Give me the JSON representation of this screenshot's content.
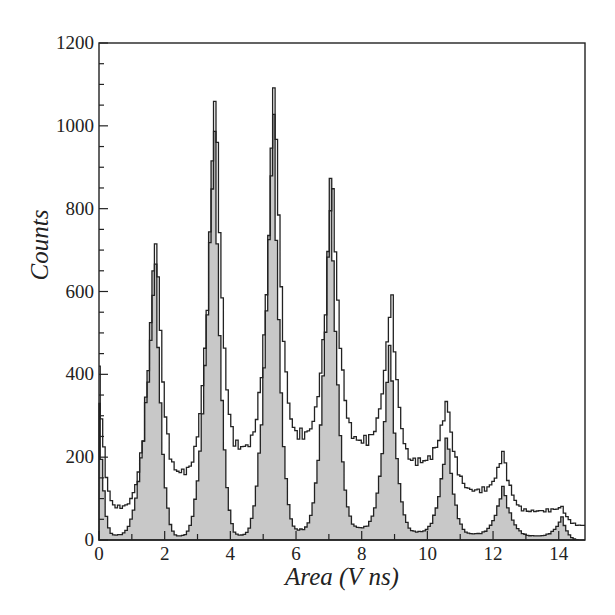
{
  "chart_data": {
    "type": "histogram",
    "title": "",
    "xlabel": "Area (V ns)",
    "ylabel": "Counts",
    "xlim": [
      0,
      14.8
    ],
    "ylim": [
      0,
      1200
    ],
    "xticks": [
      0,
      2,
      4,
      6,
      8,
      10,
      12,
      14
    ],
    "yticks": [
      0,
      200,
      400,
      600,
      800,
      1000,
      1200
    ],
    "grid": false,
    "legend": null,
    "series": [
      {
        "name": "Unfilled histogram (outline)",
        "style": "step-outline",
        "peaks": [
          {
            "x": 0.0,
            "y": 420
          },
          {
            "x": 1.75,
            "y": 760
          },
          {
            "x": 3.55,
            "y": 1125
          },
          {
            "x": 5.35,
            "y": 1150
          },
          {
            "x": 7.1,
            "y": 905
          },
          {
            "x": 8.9,
            "y": 615
          },
          {
            "x": 10.6,
            "y": 345
          },
          {
            "x": 12.3,
            "y": 215
          },
          {
            "x": 14.1,
            "y": 80
          }
        ],
        "valleys": [
          {
            "x": 0.6,
            "y": 80
          },
          {
            "x": 2.5,
            "y": 165
          },
          {
            "x": 4.35,
            "y": 225
          },
          {
            "x": 6.15,
            "y": 255
          },
          {
            "x": 8.0,
            "y": 240
          },
          {
            "x": 9.7,
            "y": 190
          },
          {
            "x": 11.5,
            "y": 120
          },
          {
            "x": 13.2,
            "y": 70
          },
          {
            "x": 14.8,
            "y": 35
          }
        ]
      },
      {
        "name": "Filled histogram (gray)",
        "style": "step-filled",
        "fill": "#c8c8c8",
        "peaks": [
          {
            "x": 0.0,
            "y": 330
          },
          {
            "x": 1.7,
            "y": 740
          },
          {
            "x": 3.5,
            "y": 1085
          },
          {
            "x": 5.3,
            "y": 1120
          },
          {
            "x": 7.05,
            "y": 880
          },
          {
            "x": 8.85,
            "y": 485
          },
          {
            "x": 10.6,
            "y": 265
          },
          {
            "x": 12.3,
            "y": 130
          },
          {
            "x": 14.1,
            "y": 55
          }
        ],
        "valleys": [
          {
            "x": 0.5,
            "y": 12
          },
          {
            "x": 2.45,
            "y": 10
          },
          {
            "x": 4.3,
            "y": 12
          },
          {
            "x": 6.1,
            "y": 25
          },
          {
            "x": 7.95,
            "y": 30
          },
          {
            "x": 9.7,
            "y": 20
          },
          {
            "x": 11.4,
            "y": 15
          },
          {
            "x": 13.3,
            "y": 10
          },
          {
            "x": 14.7,
            "y": 0
          }
        ]
      }
    ]
  },
  "labels": {
    "xlabel": "Area (V ns)",
    "ylabel": "Counts"
  }
}
